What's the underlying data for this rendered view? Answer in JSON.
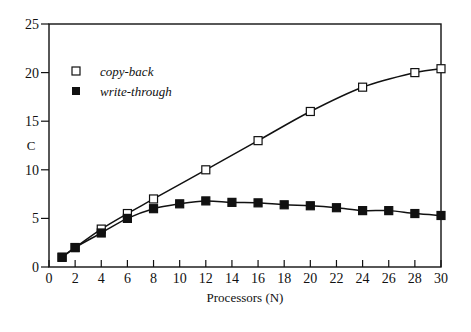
{
  "chart_data": {
    "type": "scatter",
    "title": "",
    "xlabel": "Processors (N)",
    "ylabel": "C",
    "xlim": [
      0,
      30
    ],
    "ylim": [
      0,
      25
    ],
    "xticks": [
      0,
      2,
      4,
      6,
      8,
      10,
      12,
      14,
      16,
      18,
      20,
      22,
      24,
      26,
      28,
      30
    ],
    "yticks": [
      0,
      5,
      10,
      15,
      20,
      25
    ],
    "grid": false,
    "legend_position": "upper-left",
    "series": [
      {
        "name": "copy-back",
        "marker": "open-square",
        "fitted_curve": true,
        "x": [
          1,
          2,
          4,
          6,
          8,
          12,
          16,
          20,
          24,
          28,
          30
        ],
        "y": [
          1.0,
          2.0,
          3.9,
          5.5,
          7.0,
          10.0,
          13.0,
          16.0,
          18.5,
          20.0,
          20.4
        ]
      },
      {
        "name": "write-through",
        "marker": "filled-square",
        "fitted_curve": true,
        "x": [
          1,
          2,
          4,
          6,
          8,
          10,
          12,
          14,
          16,
          18,
          20,
          22,
          24,
          26,
          28,
          30
        ],
        "y": [
          1.0,
          2.0,
          3.5,
          5.0,
          6.0,
          6.5,
          6.8,
          6.65,
          6.6,
          6.4,
          6.3,
          6.1,
          5.8,
          5.8,
          5.5,
          5.3
        ]
      }
    ]
  },
  "legend": {
    "items": [
      {
        "label": "copy-back"
      },
      {
        "label": "write-through"
      }
    ]
  }
}
